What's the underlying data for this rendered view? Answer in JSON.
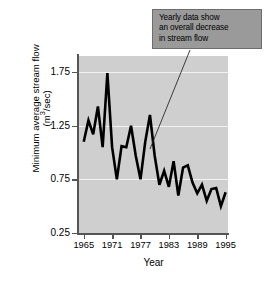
{
  "chart_data": {
    "type": "line",
    "title": "",
    "xlabel": "Year",
    "ylabel": "Minimum average stream flow (m³/sec)",
    "ylabel_line1": "Minimum average stream flow",
    "ylabel_line2_prefix": "(m",
    "ylabel_line2_exponent": "3",
    "ylabel_line2_suffix": "/sec)",
    "xlim": [
      1964,
      1995.5
    ],
    "ylim": [
      0.25,
      1.9
    ],
    "grid": true,
    "gridlines_y": [
      0.75,
      1.25,
      1.75
    ],
    "legend": "none",
    "ytick_labels": [
      "0.25",
      "0.75",
      "1.25",
      "1.75"
    ],
    "ytick_values": [
      0.25,
      0.75,
      1.25,
      1.75
    ],
    "xtick_labels": [
      "1965",
      "1971",
      "1977",
      "1983",
      "1989",
      "1995"
    ],
    "xtick_values": [
      1965,
      1971,
      1977,
      1983,
      1989,
      1995
    ],
    "series_name": "Minimum average stream flow",
    "line_color": "#000000",
    "plot_background": "#cfcfcf",
    "x": [
      1965,
      1966,
      1967,
      1968,
      1969,
      1970,
      1971,
      1972,
      1973,
      1974,
      1975,
      1976,
      1977,
      1978,
      1979,
      1980,
      1981,
      1982,
      1983,
      1984,
      1985,
      1986,
      1987,
      1988,
      1989,
      1990,
      1991,
      1992,
      1993,
      1994,
      1995
    ],
    "y": [
      1.1,
      1.3,
      1.17,
      1.43,
      1.05,
      1.74,
      1.05,
      0.75,
      1.06,
      1.05,
      1.25,
      0.97,
      0.75,
      1.1,
      1.35,
      0.97,
      0.7,
      0.83,
      0.68,
      0.92,
      0.6,
      0.86,
      0.88,
      0.72,
      0.62,
      0.7,
      0.55,
      0.66,
      0.67,
      0.5,
      0.63
    ],
    "annotation": {
      "name": "trend-callout",
      "lines": [
        "Yearly data show",
        "an overall decrease",
        "in stream flow"
      ],
      "box_fill": "#9a9a9a",
      "box_border": "#6d6d6d",
      "leader_from": [
        190,
        50
      ],
      "leader_to": [
        150,
        149
      ]
    }
  }
}
